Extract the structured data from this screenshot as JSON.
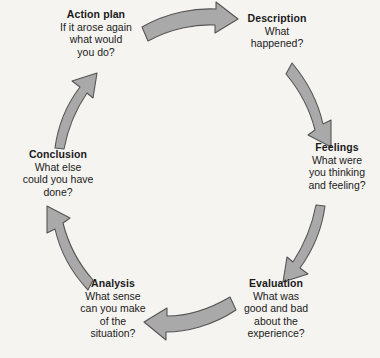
{
  "diagram": {
    "name": "Reflective cycle",
    "direction": "clockwise",
    "background_color": "#f6f4f1",
    "arrow_fill_color": "#a9a9a9",
    "arrow_stroke_color": "#555555",
    "text_color": "#1a1a1a",
    "stages": [
      {
        "id": "action-plan",
        "title": "Action plan",
        "body": "If it arose again\nwhat would\nyou do?"
      },
      {
        "id": "description",
        "title": "Description",
        "body": "What\nhappened?"
      },
      {
        "id": "feelings",
        "title": "Feelings",
        "body": "What were\nyou thinking\nand feeling?"
      },
      {
        "id": "evaluation",
        "title": "Evaluation",
        "body": "What was\ngood and bad\nabout the\nexperience?"
      },
      {
        "id": "analysis",
        "title": "Analysis",
        "body": "What sense\ncan you make\nof the\nsituation?"
      },
      {
        "id": "conclusion",
        "title": "Conclusion",
        "body": "What else\ncould you have\ndone?"
      }
    ],
    "arrows": [
      {
        "id": "action-plan-to-description",
        "from": "Action plan",
        "to": "Description"
      },
      {
        "id": "description-to-feelings",
        "from": "Description",
        "to": "Feelings"
      },
      {
        "id": "feelings-to-evaluation",
        "from": "Feelings",
        "to": "Evaluation"
      },
      {
        "id": "evaluation-to-analysis",
        "from": "Evaluation",
        "to": "Analysis"
      },
      {
        "id": "analysis-to-conclusion",
        "from": "Analysis",
        "to": "Conclusion"
      },
      {
        "id": "conclusion-to-action-plan",
        "from": "Conclusion",
        "to": "Action plan"
      }
    ]
  }
}
